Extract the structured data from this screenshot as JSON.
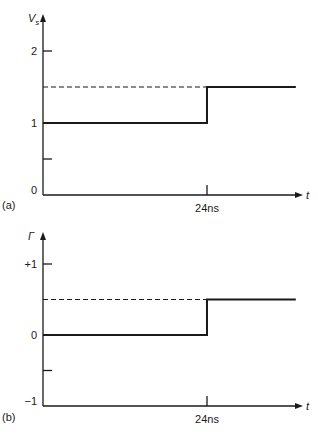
{
  "chart_data": [
    {
      "type": "line",
      "panel_label": "(a)",
      "ylabel": "V",
      "ylabel_sub": "s",
      "xlabel": "t",
      "yticks": [
        {
          "value": 0,
          "label": "0"
        },
        {
          "value": 0.5,
          "label": ""
        },
        {
          "value": 1,
          "label": "1"
        },
        {
          "value": 2,
          "label": "2"
        }
      ],
      "xticks": [
        {
          "value": 24,
          "label": "24ns"
        }
      ],
      "ylim": [
        0,
        2.4
      ],
      "xlim": [
        0,
        50
      ],
      "series": [
        {
          "name": "signal",
          "style": "solid",
          "points": [
            [
              0,
              1
            ],
            [
              24,
              1
            ],
            [
              24,
              1.5
            ],
            [
              37,
              1.5
            ]
          ]
        },
        {
          "name": "reference",
          "style": "dashed",
          "points": [
            [
              0,
              1.5
            ],
            [
              24,
              1.5
            ]
          ]
        }
      ]
    },
    {
      "type": "line",
      "panel_label": "(b)",
      "ylabel": "Γ",
      "ylabel_sub": "",
      "xlabel": "t",
      "yticks": [
        {
          "value": -1,
          "label": "−1"
        },
        {
          "value": -0.5,
          "label": ""
        },
        {
          "value": 0,
          "label": "0"
        },
        {
          "value": 1,
          "label": "+1"
        }
      ],
      "xticks": [
        {
          "value": 24,
          "label": "24ns"
        }
      ],
      "ylim": [
        -1,
        1.45
      ],
      "xlim": [
        0,
        50
      ],
      "series": [
        {
          "name": "signal",
          "style": "solid",
          "points": [
            [
              0,
              0
            ],
            [
              24,
              0
            ],
            [
              24,
              0.5
            ],
            [
              37,
              0.5
            ]
          ]
        },
        {
          "name": "reference",
          "style": "dashed",
          "points": [
            [
              0,
              0.5
            ],
            [
              24,
              0.5
            ]
          ]
        }
      ]
    }
  ]
}
